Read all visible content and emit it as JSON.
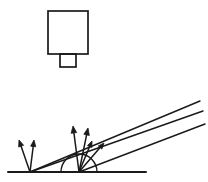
{
  "figure": {
    "background_color": "#ffffff",
    "stroke_color": "#1a1a1a",
    "canvas": {
      "width": 208,
      "height": 182
    }
  },
  "detector": {
    "name": "detector-body",
    "body": {
      "x": 48,
      "y": 11,
      "width": 40,
      "height": 43,
      "stroke_width": 1.7
    },
    "stem": {
      "x": 60,
      "y": 54,
      "width": 16,
      "height": 13,
      "stroke_width": 1.7
    }
  },
  "surface": {
    "name": "baseline",
    "x1": 8,
    "y1": 172,
    "x2": 146,
    "y2": 172,
    "stroke_width": 2.0
  },
  "arc": {
    "name": "angle-arc",
    "cx": 79,
    "cy": 172,
    "r": 18,
    "stroke_width": 1.4,
    "start_x": 61,
    "end_x": 97
  },
  "rays": [
    {
      "name": "ray-upper",
      "x1": 30,
      "y1": 172,
      "x2": 200,
      "y2": 101,
      "stroke_width": 1.4
    },
    {
      "name": "ray-middle",
      "x1": 30,
      "y1": 172,
      "x2": 203,
      "y2": 111,
      "stroke_width": 1.4
    },
    {
      "name": "ray-lower",
      "x1": 79,
      "y1": 172,
      "x2": 205,
      "y2": 124,
      "stroke_width": 1.4
    }
  ],
  "arrows": [
    {
      "name": "arrow-left-outer",
      "x1": 30,
      "y1": 172,
      "x2": 19,
      "y2": 140,
      "stroke_width": 1.5,
      "head": 6.5
    },
    {
      "name": "arrow-left-inner",
      "x1": 30,
      "y1": 172,
      "x2": 34,
      "y2": 140,
      "stroke_width": 1.5,
      "head": 6.5
    },
    {
      "name": "arrow-right-vertical",
      "x1": 79,
      "y1": 172,
      "x2": 73,
      "y2": 126,
      "stroke_width": 1.5,
      "head": 7.0
    },
    {
      "name": "arrow-right-tilted",
      "x1": 79,
      "y1": 172,
      "x2": 88,
      "y2": 128,
      "stroke_width": 1.5,
      "head": 7.0
    },
    {
      "name": "arrow-mid-short",
      "x1": 79,
      "y1": 172,
      "x2": 92,
      "y2": 141,
      "stroke_width": 1.5,
      "head": 6.0
    },
    {
      "name": "arrow-right-short",
      "x1": 79,
      "y1": 172,
      "x2": 104,
      "y2": 143,
      "stroke_width": 1.5,
      "head": 6.0
    }
  ]
}
